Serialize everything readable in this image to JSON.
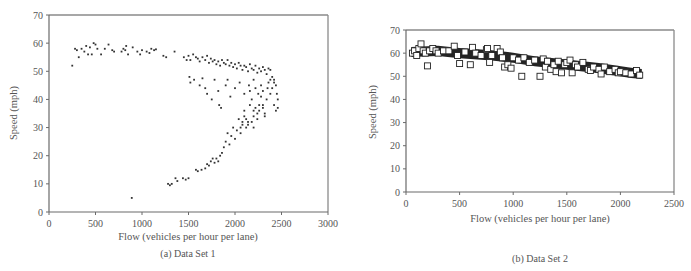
{
  "chart_data": [
    {
      "type": "scatter",
      "caption": "(a) Data Set 1",
      "title": "",
      "xlabel": "Flow (vehicles per hour per lane)",
      "ylabel": "Speed (mph)",
      "xlim": [
        0,
        3000
      ],
      "ylim": [
        0,
        70
      ],
      "xticks": [
        0,
        500,
        1000,
        1500,
        2000,
        2500,
        3000
      ],
      "yticks": [
        0,
        10,
        20,
        30,
        40,
        50,
        60,
        70
      ],
      "grid": false,
      "legend": null,
      "marker": "dot",
      "series": [
        {
          "name": "Data Set 1",
          "points": [
            [
              250,
              52
            ],
            [
              280,
              58
            ],
            [
              300,
              57.5
            ],
            [
              320,
              55
            ],
            [
              350,
              58
            ],
            [
              380,
              57
            ],
            [
              400,
              59
            ],
            [
              420,
              56
            ],
            [
              440,
              58.5
            ],
            [
              460,
              56
            ],
            [
              480,
              60
            ],
            [
              500,
              59.5
            ],
            [
              520,
              58
            ],
            [
              560,
              56
            ],
            [
              600,
              58
            ],
            [
              640,
              59.5
            ],
            [
              680,
              57.5
            ],
            [
              700,
              57
            ],
            [
              780,
              57
            ],
            [
              800,
              58
            ],
            [
              820,
              57.5
            ],
            [
              830,
              59
            ],
            [
              850,
              56
            ],
            [
              900,
              58.5
            ],
            [
              950,
              57
            ],
            [
              980,
              56
            ],
            [
              1000,
              57.5
            ],
            [
              1050,
              57
            ],
            [
              1080,
              56.5
            ],
            [
              1100,
              58
            ],
            [
              1130,
              57.5
            ],
            [
              1150,
              57.8
            ],
            [
              1230,
              55.5
            ],
            [
              1260,
              55
            ],
            [
              1350,
              57
            ],
            [
              1450,
              55
            ],
            [
              1480,
              54
            ],
            [
              1500,
              55.5
            ],
            [
              1520,
              54
            ],
            [
              1550,
              56
            ],
            [
              1580,
              55
            ],
            [
              1600,
              54.5
            ],
            [
              1620,
              53.5
            ],
            [
              1650,
              55
            ],
            [
              1680,
              54
            ],
            [
              1700,
              55.5
            ],
            [
              1720,
              53
            ],
            [
              1740,
              54.5
            ],
            [
              1760,
              53.5
            ],
            [
              1780,
              54
            ],
            [
              1800,
              52.5
            ],
            [
              1820,
              53.5
            ],
            [
              1840,
              52
            ],
            [
              1860,
              54
            ],
            [
              1880,
              53
            ],
            [
              1900,
              52.5
            ],
            [
              1920,
              54
            ],
            [
              1940,
              52
            ],
            [
              1960,
              53
            ],
            [
              1980,
              51.5
            ],
            [
              2000,
              52.5
            ],
            [
              2020,
              51
            ],
            [
              2040,
              53
            ],
            [
              2060,
              52
            ],
            [
              2080,
              50.5
            ],
            [
              2100,
              52
            ],
            [
              2120,
              51.5
            ],
            [
              2140,
              50
            ],
            [
              2160,
              52.5
            ],
            [
              2180,
              51
            ],
            [
              2200,
              50.5
            ],
            [
              2220,
              52
            ],
            [
              2240,
              49.5
            ],
            [
              2260,
              51
            ],
            [
              2280,
              50
            ],
            [
              2300,
              51.5
            ],
            [
              2320,
              50.5
            ],
            [
              2340,
              49
            ],
            [
              2360,
              51
            ],
            [
              2380,
              50.5
            ],
            [
              2400,
              48
            ],
            [
              2420,
              47
            ],
            [
              2440,
              45
            ],
            [
              2450,
              42
            ],
            [
              2460,
              40
            ],
            [
              2460,
              37
            ],
            [
              2440,
              36
            ],
            [
              2420,
              38
            ],
            [
              2400,
              44
            ],
            [
              2380,
              42
            ],
            [
              2360,
              46
            ],
            [
              2340,
              40
            ],
            [
              2320,
              35
            ],
            [
              2300,
              38
            ],
            [
              2280,
              41
            ],
            [
              2260,
              36
            ],
            [
              2240,
              33
            ],
            [
              2220,
              37
            ],
            [
              2200,
              34
            ],
            [
              2180,
              40
            ],
            [
              2160,
              43
            ],
            [
              2140,
              32
            ],
            [
              2120,
              30
            ],
            [
              2100,
              34
            ],
            [
              2080,
              31
            ],
            [
              2060,
              28
            ],
            [
              2040,
              33
            ],
            [
              2020,
              29
            ],
            [
              2000,
              26
            ],
            [
              1980,
              30
            ],
            [
              1960,
              27
            ],
            [
              1940,
              24
            ],
            [
              1920,
              28
            ],
            [
              1900,
              25
            ],
            [
              1880,
              23
            ],
            [
              1860,
              21
            ],
            [
              1840,
              20
            ],
            [
              1820,
              18
            ],
            [
              1800,
              19
            ],
            [
              1780,
              17.5
            ],
            [
              1760,
              19
            ],
            [
              1740,
              18
            ],
            [
              1720,
              16.5
            ],
            [
              1700,
              17
            ],
            [
              1680,
              15.5
            ],
            [
              1640,
              15
            ],
            [
              1600,
              14.5
            ],
            [
              1580,
              15
            ],
            [
              1500,
              12
            ],
            [
              1470,
              11.5
            ],
            [
              1440,
              12
            ],
            [
              1380,
              11
            ],
            [
              1360,
              12
            ],
            [
              1320,
              10
            ],
            [
              1300,
              9.5
            ],
            [
              1280,
              10
            ],
            [
              890,
              5
            ],
            [
              1510,
              48
            ],
            [
              1520,
              46
            ],
            [
              1560,
              47
            ],
            [
              1620,
              45
            ],
            [
              1650,
              47.5
            ],
            [
              1680,
              44
            ],
            [
              1700,
              42
            ],
            [
              1750,
              40
            ],
            [
              1780,
              47
            ],
            [
              1820,
              43
            ],
            [
              1830,
              38
            ],
            [
              1850,
              37
            ],
            [
              1900,
              45
            ],
            [
              1920,
              47
            ],
            [
              1950,
              41
            ],
            [
              2000,
              44
            ],
            [
              2050,
              46
            ],
            [
              2100,
              42
            ],
            [
              2150,
              45
            ],
            [
              2200,
              47
            ],
            [
              2220,
              44
            ],
            [
              2250,
              42
            ],
            [
              2280,
              45
            ],
            [
              2300,
              43
            ],
            [
              2350,
              44
            ],
            [
              2380,
              47
            ],
            [
              2420,
              46
            ],
            [
              2160,
              38
            ],
            [
              2200,
              36
            ],
            [
              2240,
              35
            ],
            [
              2260,
              38
            ],
            [
              2300,
              37
            ],
            [
              2320,
              34
            ],
            [
              2100,
              36
            ],
            [
              2080,
              32
            ],
            [
              2060,
              30
            ],
            [
              2120,
              33
            ],
            [
              2140,
              31
            ],
            [
              2180,
              32
            ],
            [
              2200,
              30
            ]
          ]
        }
      ]
    },
    {
      "type": "scatter",
      "caption": "(b) Data Set 2",
      "title": "",
      "xlabel": "Flow (vehicles per hour per lane)",
      "ylabel": "Speed (mph)",
      "xlim": [
        0,
        2500
      ],
      "ylim": [
        0,
        70
      ],
      "xticks": [
        0,
        500,
        1000,
        1500,
        2000,
        2500
      ],
      "yticks": [
        0,
        10,
        20,
        30,
        40,
        50,
        60,
        70
      ],
      "grid": false,
      "legend": null,
      "marker": "open-square",
      "trend": [
        [
          50,
          60.5
        ],
        [
          300,
          61
        ],
        [
          500,
          60
        ],
        [
          800,
          59
        ],
        [
          1000,
          58
        ],
        [
          1200,
          56.5
        ],
        [
          1500,
          55
        ],
        [
          1800,
          53.5
        ],
        [
          2100,
          51.5
        ],
        [
          2200,
          51
        ]
      ],
      "series": [
        {
          "name": "Data Set 2",
          "points": [
            [
              60,
              60
            ],
            [
              80,
              61
            ],
            [
              100,
              59
            ],
            [
              120,
              62
            ],
            [
              140,
              64
            ],
            [
              160,
              61
            ],
            [
              180,
              60
            ],
            [
              200,
              54.5
            ],
            [
              220,
              61
            ],
            [
              250,
              62
            ],
            [
              280,
              61
            ],
            [
              300,
              60
            ],
            [
              350,
              61
            ],
            [
              400,
              61
            ],
            [
              450,
              63
            ],
            [
              480,
              59
            ],
            [
              500,
              55.5
            ],
            [
              550,
              60.5
            ],
            [
              600,
              55
            ],
            [
              620,
              62.5
            ],
            [
              650,
              60
            ],
            [
              700,
              59
            ],
            [
              750,
              61.5
            ],
            [
              760,
              62
            ],
            [
              780,
              56
            ],
            [
              800,
              59
            ],
            [
              850,
              62
            ],
            [
              880,
              60.5
            ],
            [
              900,
              58
            ],
            [
              920,
              54
            ],
            [
              950,
              55
            ],
            [
              980,
              53.5
            ],
            [
              1000,
              58
            ],
            [
              1050,
              57
            ],
            [
              1080,
              50
            ],
            [
              1100,
              58
            ],
            [
              1150,
              56
            ],
            [
              1200,
              57
            ],
            [
              1250,
              50
            ],
            [
              1280,
              57.5
            ],
            [
              1300,
              54
            ],
            [
              1320,
              56.5
            ],
            [
              1350,
              53
            ],
            [
              1380,
              55
            ],
            [
              1400,
              52
            ],
            [
              1420,
              56.5
            ],
            [
              1450,
              51.5
            ],
            [
              1480,
              55
            ],
            [
              1500,
              56
            ],
            [
              1530,
              57
            ],
            [
              1550,
              51.5
            ],
            [
              1580,
              55
            ],
            [
              1600,
              54
            ],
            [
              1650,
              56
            ],
            [
              1700,
              53
            ],
            [
              1720,
              52.5
            ],
            [
              1750,
              54
            ],
            [
              1800,
              53
            ],
            [
              1820,
              51
            ],
            [
              1850,
              54
            ],
            [
              1900,
              52
            ],
            [
              1950,
              53
            ],
            [
              1980,
              51.5
            ],
            [
              2000,
              52
            ],
            [
              2050,
              51.5
            ],
            [
              2100,
              51
            ],
            [
              2150,
              52.5
            ],
            [
              2180,
              50.5
            ]
          ]
        }
      ]
    }
  ],
  "charts": [
    {
      "caption": "(a) Data Set 1",
      "xlabel": "Flow (vehicles per hour per lane)",
      "ylabel": "Speed (mph)"
    },
    {
      "caption": "(b) Data Set 2",
      "xlabel": "Flow (vehicles per hour per lane)",
      "ylabel": "Speed (mph)"
    }
  ],
  "colors": {
    "axis": "#6a6a6a",
    "frame": "#8a8a8a",
    "marker": "#333333",
    "text": "#555555"
  }
}
